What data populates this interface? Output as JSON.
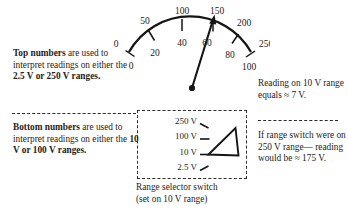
{
  "figure": {
    "background": "#ffffff",
    "ink": "#1a1a1a"
  },
  "meter": {
    "name": "analog-multimeter-scale",
    "top_scale_label": "top numbers",
    "bottom_scale_label": "bottom numbers",
    "top_numbers": [
      "0",
      "50",
      "100",
      "150",
      "200",
      "250"
    ],
    "bottom_numbers": [
      "0",
      "20",
      "40",
      "60",
      "80",
      "100"
    ],
    "needle": {
      "reading_top_scale": "~175",
      "reading_bottom_scale": "~70"
    }
  },
  "annotations": {
    "top_left": {
      "lead_bold": "Top numbers",
      "body_1": " are used to interpret readings on either the ",
      "emph": "2.5 V or 250 V ranges.",
      "full": "Top numbers are used to interpret readings on either the 2.5 V or 250 V ranges."
    },
    "bottom_left": {
      "lead_bold": "Bottom numbers",
      "body_1": " are used to interpret readings on either the ",
      "emph": "10 V or 100 V ranges.",
      "full": "Bottom numbers are used to interpret readings on either the 10 V or 100 V ranges."
    },
    "top_right": {
      "text": "Reading on 10 V range equals ≈ 7 V."
    },
    "bottom_right": {
      "text": "If range switch were on 250 V range— reading would be ≈ 175 V."
    }
  },
  "range_switch": {
    "options": [
      "250 V",
      "100 V",
      "10 V",
      "2.5 V"
    ],
    "selected": "10 V",
    "caption_line_1": "Range selector switch",
    "caption_line_2": "(set on 10 V range)"
  }
}
